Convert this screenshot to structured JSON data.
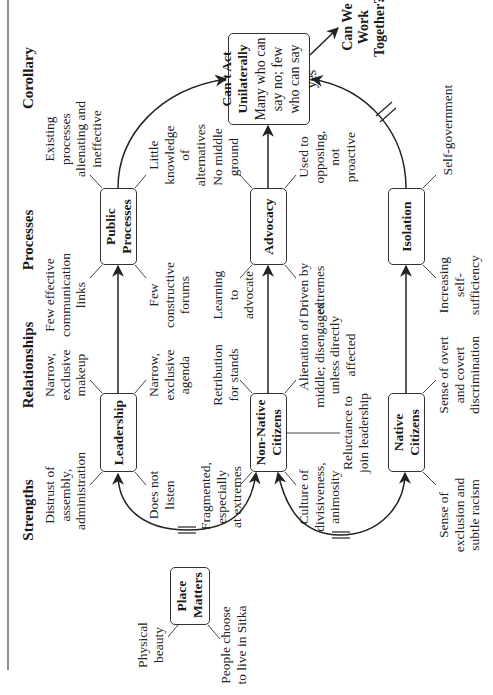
{
  "columns": [
    {
      "label": "Strengths"
    },
    {
      "label": "Relationships"
    },
    {
      "label": "Processes"
    },
    {
      "label": "Corollary"
    }
  ],
  "nodes": {
    "place_matters": {
      "title": "Place Matters"
    },
    "leadership": {
      "title": "Leadership"
    },
    "public_processes": {
      "title": "Public Processes"
    },
    "cant_act": {
      "title": "Can't Act Unilaterally",
      "subtitle": "Many who can say no; few who can say yes"
    },
    "non_native": {
      "title": "Non-Native Citizens"
    },
    "advocacy": {
      "title": "Advocacy"
    },
    "native": {
      "title": "Native Citizens"
    },
    "isolation": {
      "title": "Isolation"
    }
  },
  "outcome": {
    "label": "Can We Work Together?"
  },
  "notes": {
    "place_matters": [
      "Physical beauty",
      "People choose to live in Sitka"
    ],
    "leadership": [
      "Distrust of assembly, administration",
      "Does not listen",
      "Narrow, exclusive makeup",
      "Narrow, exclusive agenda"
    ],
    "public_processes": [
      "Few effective communication links",
      "Few constructive forums",
      "Existing processes alienating and ineffective",
      "Little knowledge of alternatives"
    ],
    "non_native": [
      "Fragmented, especially at extremes",
      "Culture of divisiveness, animosity",
      "Retribution for stands",
      "Alienation of middle; disengaged unless directly affected",
      "Reluctance to join leadership"
    ],
    "advocacy": [
      "Learning to advocate",
      "Driven by extremes",
      "No middle ground",
      "Used to opposing, not proactive"
    ],
    "native": [
      "Sense of exclusion and subtle racism",
      "Sense of overt and covert discrimination"
    ],
    "isolation": [
      "Increasing self-sufficiency",
      "Self-government"
    ]
  },
  "colors": {
    "line": "#222222",
    "box_border": "#333333",
    "text": "#1a1a1a"
  }
}
